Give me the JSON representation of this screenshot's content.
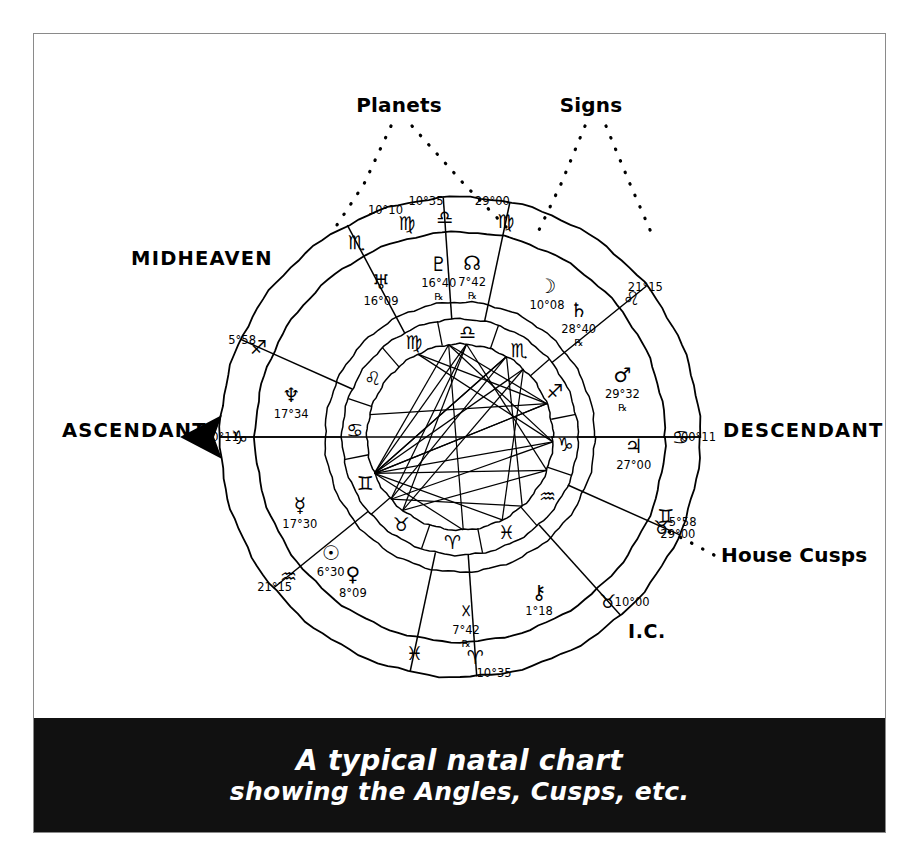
{
  "figure": {
    "caption_line1": "A typical natal chart",
    "caption_line2": "showing the Angles, Cusps, etc.",
    "border_color": "#8a8a8a",
    "caption_bg": "#111111",
    "caption_fg": "#ffffff",
    "ink_color": "#000000"
  },
  "callouts": {
    "planets": "Planets",
    "signs": "Signs",
    "house_cusps": "House Cusps"
  },
  "angles": {
    "midheaven": "MIDHEAVEN",
    "ascendant": "ASCENDANT",
    "descendant": "DESCENDANT",
    "ic": "I.C."
  },
  "chart_data": {
    "type": "wheel",
    "title": "A typical natal chart",
    "ascendant_sign": "Capricorn",
    "ascendant_degree": "00°11",
    "house_cusps": [
      {
        "house": 1,
        "sign": "Capricorn",
        "glyph": "♑",
        "degree": "00°11",
        "angle_deg": 180
      },
      {
        "house": 2,
        "sign": "Aquarius",
        "glyph": "♒",
        "degree": "21°15",
        "angle_deg": 219
      },
      {
        "house": 3,
        "sign": "Pisces",
        "glyph": "♓",
        "degree": "",
        "angle_deg": 258
      },
      {
        "house": 4,
        "sign": "Aries",
        "glyph": "♈",
        "degree": "10°35",
        "angle_deg": 274
      },
      {
        "house": 5,
        "sign": "Taurus",
        "glyph": "♉",
        "degree": "10°00",
        "angle_deg": 312
      },
      {
        "house": 6,
        "sign": "Taurus",
        "glyph": "♉",
        "degree": "29°00",
        "angle_deg": 336
      },
      {
        "house": 7,
        "sign": "Cancer",
        "glyph": "♋",
        "degree": "00°11",
        "angle_deg": 0
      },
      {
        "house": 8,
        "sign": "Leo",
        "glyph": "♌",
        "degree": "21°15",
        "angle_deg": 39
      },
      {
        "house": 9,
        "sign": "Virgo",
        "glyph": "♍",
        "degree": "29°00",
        "angle_deg": 78
      },
      {
        "house": 10,
        "sign": "Libra",
        "glyph": "♎",
        "degree": "10°35",
        "angle_deg": 94
      },
      {
        "house": 11,
        "sign": "Scorpio",
        "glyph": "♏",
        "degree": "",
        "angle_deg": 118
      },
      {
        "house": 12,
        "sign": "Sagittarius",
        "glyph": "♐",
        "degree": "5°58",
        "angle_deg": 156
      },
      {
        "house": 13,
        "sign": "Gemini",
        "glyph": "♊",
        "degree": "5°58",
        "angle_deg": 339
      },
      {
        "house": 14,
        "sign": "Virgo",
        "glyph": "♍",
        "degree": "10°10",
        "angle_deg": 104
      }
    ],
    "planets": [
      {
        "name": "Pluto",
        "glyph": "♇",
        "degree": "16°40",
        "retrograde": true,
        "angle_deg": 97
      },
      {
        "name": "North Node",
        "glyph": "☊",
        "degree": "7°42",
        "retrograde": true,
        "angle_deg": 86
      },
      {
        "name": "Moon",
        "glyph": "☽",
        "degree": "10°08",
        "retrograde": false,
        "angle_deg": 60
      },
      {
        "name": "Saturn",
        "glyph": "♄",
        "degree": "28°40",
        "retrograde": true,
        "angle_deg": 47
      },
      {
        "name": "Mars",
        "glyph": "♂",
        "degree": "29°32",
        "retrograde": true,
        "angle_deg": 21
      },
      {
        "name": "Jupiter",
        "glyph": "♃",
        "degree": "27°00",
        "retrograde": false,
        "angle_deg": 357
      },
      {
        "name": "Uranus",
        "glyph": "♅",
        "degree": "16°09",
        "retrograde": false,
        "angle_deg": 117
      },
      {
        "name": "Neptune",
        "glyph": "♆",
        "degree": "17°34",
        "retrograde": false,
        "angle_deg": 166
      },
      {
        "name": "Mercury",
        "glyph": "☿",
        "degree": "17°30",
        "retrograde": false,
        "angle_deg": 203
      },
      {
        "name": "Sun",
        "glyph": "☉",
        "degree": "6°30",
        "retrograde": false,
        "angle_deg": 222
      },
      {
        "name": "Venus",
        "glyph": "♀",
        "degree": "8°09",
        "retrograde": false,
        "angle_deg": 232
      },
      {
        "name": "South Node",
        "glyph": "☓",
        "degree": "7°42",
        "retrograde": true,
        "angle_deg": 272
      },
      {
        "name": "Chiron",
        "glyph": "⚷",
        "degree": "1°18",
        "retrograde": false,
        "angle_deg": 297
      }
    ],
    "inner_zodiac_ring": [
      {
        "sign": "Libra",
        "glyph": "♎"
      },
      {
        "sign": "Scorpio",
        "glyph": "♏"
      },
      {
        "sign": "Sagittarius",
        "glyph": "♐"
      },
      {
        "sign": "Capricorn",
        "glyph": "♑"
      },
      {
        "sign": "Aquarius",
        "glyph": "♒"
      },
      {
        "sign": "Pisces",
        "glyph": "♓"
      },
      {
        "sign": "Aries",
        "glyph": "♈"
      },
      {
        "sign": "Taurus",
        "glyph": "♉"
      },
      {
        "sign": "Gemini",
        "glyph": "♊"
      },
      {
        "sign": "Cancer",
        "glyph": "♋"
      },
      {
        "sign": "Leo",
        "glyph": "♌"
      },
      {
        "sign": "Virgo",
        "glyph": "♍"
      }
    ],
    "rings": {
      "outer_radius": 240,
      "cusp_ring_radius": 205,
      "planet_ring_radius": 135,
      "inner_zodiac_outer_radius": 118,
      "inner_zodiac_inner_radius": 93
    }
  }
}
